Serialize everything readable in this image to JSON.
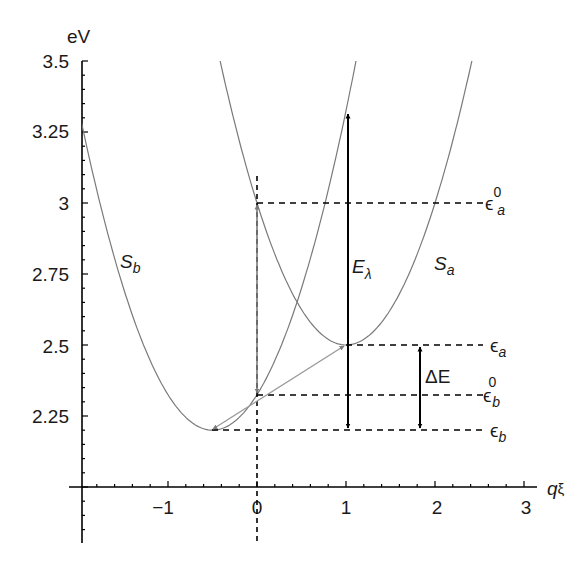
{
  "chart_data": {
    "type": "line",
    "title": "",
    "xlabel": "qξ",
    "ylabel": "eV",
    "xlim": [
      -2,
      3
    ],
    "ylim": [
      2.0,
      3.5
    ],
    "grid": false,
    "x_ticks": [
      "−1",
      "0",
      "1",
      "2",
      "3"
    ],
    "y_ticks": [
      "2.25",
      "2.5",
      "2.75",
      "3",
      "3.25",
      "3.5"
    ],
    "series": [
      {
        "name": "S_b",
        "formula": "2.2 + 0.5*(q+0.5)^2",
        "minimum": {
          "q": -0.5,
          "E": 2.2
        },
        "color": "#7a7a7a"
      },
      {
        "name": "S_a",
        "formula": "2.5 + 0.5*(q-1)^2",
        "minimum": {
          "q": 1.0,
          "E": 2.5
        },
        "color": "#7a7a7a"
      }
    ],
    "levels": [
      {
        "name": "ε_a^0",
        "E": 3.0,
        "from_q": 0
      },
      {
        "name": "ε_a",
        "E": 2.5,
        "from_q": 1
      },
      {
        "name": "ε_b^0",
        "E": 2.325,
        "from_q": 0
      },
      {
        "name": "ε_b",
        "E": 2.2,
        "from_q": -0.5
      }
    ],
    "arrows": [
      {
        "name": "E_λ",
        "q": 1,
        "from_E": 2.2,
        "to_E": 3.325,
        "color": "#000000",
        "double": true
      },
      {
        "name": "ΔE",
        "q": 1.8,
        "from_E": 2.2,
        "to_E": 2.5,
        "color": "#000000",
        "double": true
      },
      {
        "name": "vertical-gray",
        "q": 0,
        "from_E": 2.325,
        "to_E": 3.0,
        "color": "#808080",
        "double": true
      },
      {
        "name": "diagonal-gray",
        "from": {
          "q": -0.5,
          "E": 2.2
        },
        "to": {
          "q": 1,
          "E": 2.5
        },
        "color": "#808080",
        "double": true
      }
    ]
  },
  "labels": {
    "ylabel": "eV",
    "xlabel_q": "q",
    "xlabel_xi": "ξ",
    "y": [
      "3.5",
      "3.25",
      "3",
      "2.75",
      "2.5",
      "2.25"
    ],
    "x": [
      "−1",
      "0",
      "1",
      "2",
      "3"
    ],
    "Sb_main": "S",
    "Sb_sub": "b",
    "Sa_main": "S",
    "Sa_sub": "a",
    "El_main": "E",
    "El_sub": "λ",
    "dE": "ΔE",
    "eps": "ϵ",
    "eps_a0_sup": "0",
    "eps_a0_sub": "a",
    "eps_a_sub": "a",
    "eps_b0_sup": "0",
    "eps_b0_sub": "b",
    "eps_b_sub": "b"
  }
}
